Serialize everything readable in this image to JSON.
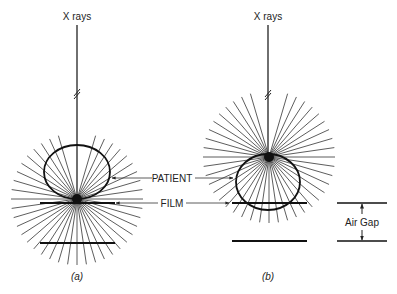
{
  "diagram": {
    "panels": [
      {
        "id": "a",
        "caption": "(a)",
        "source_label": "X rays",
        "description": "Patient in contact with film; scatter originates near film"
      },
      {
        "id": "b",
        "caption": "(b)",
        "source_label": "X rays",
        "description": "Air gap between patient and film; scatter diverges before reaching film"
      }
    ],
    "labels": {
      "patient": "PATIENT",
      "film": "FILM",
      "air_gap": "Air Gap"
    },
    "colors": {
      "line": "#1a1a1a",
      "ray": "#333333",
      "background": "#ffffff"
    }
  }
}
